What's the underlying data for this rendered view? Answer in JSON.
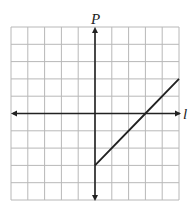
{
  "chart_data": {
    "type": "line",
    "title": "",
    "xlabel": "l",
    "ylabel": "P",
    "xlim": [
      -5,
      5
    ],
    "ylim": [
      -5,
      5
    ],
    "grid": true,
    "grid_step": 1,
    "tick_labels": false,
    "series": [
      {
        "name": "P vs l",
        "points": [
          [
            0,
            -3
          ],
          [
            3,
            0
          ],
          [
            5,
            2
          ]
        ],
        "equation": "P = l - 3",
        "color": "#222222"
      }
    ]
  },
  "labels": {
    "x_axis": "l",
    "y_axis": "P"
  },
  "colors": {
    "grid": "#b8b8b8",
    "axis": "#222222",
    "line": "#222222",
    "background": "#ffffff"
  }
}
